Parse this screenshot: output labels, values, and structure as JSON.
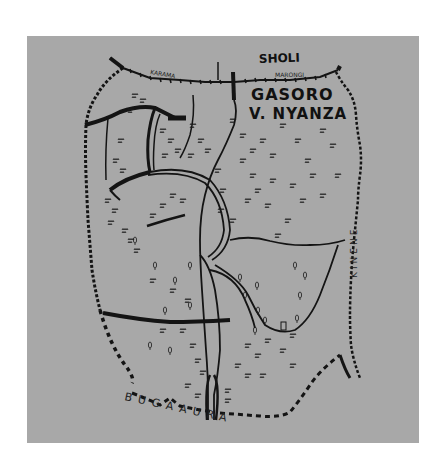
{
  "map": {
    "title": "GASORO",
    "subtitle": "V. NYANZA",
    "labels": {
      "north": "SHOLI",
      "northwest": "KARAMA",
      "north_border": "MARONGI",
      "east": "KINENE",
      "south": "BUGAAURA"
    },
    "background_color": "#a8a8a8",
    "ink_color": "#141414",
    "style": "hand-drawn sketch map"
  }
}
